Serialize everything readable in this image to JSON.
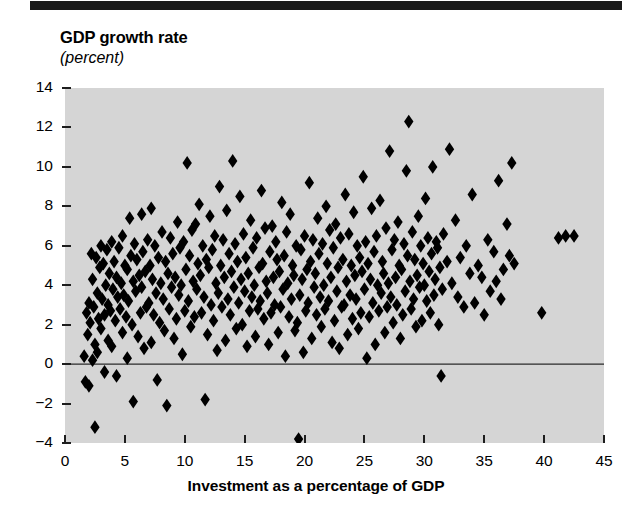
{
  "figure": {
    "title": "GDP growth rate",
    "subtitle": "(percent)",
    "xaxis_title": "Investment as a percentage of GDP",
    "plot_background_color": "#d5d5d5",
    "marker_color": "#000000",
    "rule_color": "#1a1a1a"
  },
  "chart_data": {
    "type": "scatter",
    "title": "GDP growth rate",
    "subtitle": "(percent)",
    "xlabel": "Investment as a percentage of GDP",
    "ylabel": "GDP growth rate (percent)",
    "xlim": [
      0,
      45
    ],
    "ylim": [
      -4,
      14
    ],
    "xticks": [
      0,
      5,
      10,
      15,
      20,
      25,
      30,
      35,
      40,
      45
    ],
    "yticks": [
      -4,
      -2,
      0,
      2,
      4,
      6,
      8,
      10,
      12,
      14
    ],
    "xtick_labels": [
      "0",
      "5",
      "10",
      "15",
      "20",
      "25",
      "30",
      "35",
      "40",
      "45"
    ],
    "ytick_labels": [
      "-4",
      "-2",
      "0",
      "2",
      "4",
      "6",
      "8",
      "10",
      "12",
      "14"
    ],
    "grid": false,
    "legend": null,
    "zero_line": 0,
    "marker": "diamond",
    "marker_color": "#000000",
    "n_points": 396,
    "points": [
      [
        1.6,
        0.4
      ],
      [
        1.7,
        -0.9
      ],
      [
        1.8,
        2.6
      ],
      [
        1.9,
        1.5
      ],
      [
        2.0,
        3.1
      ],
      [
        2.0,
        -1.1
      ],
      [
        2.1,
        2.1
      ],
      [
        2.2,
        5.6
      ],
      [
        2.3,
        4.3
      ],
      [
        2.3,
        0.2
      ],
      [
        2.4,
        2.9
      ],
      [
        2.5,
        -3.2
      ],
      [
        2.5,
        1.0
      ],
      [
        2.6,
        5.4
      ],
      [
        2.7,
        3.6
      ],
      [
        2.7,
        0.6
      ],
      [
        2.8,
        2.3
      ],
      [
        2.9,
        4.9
      ],
      [
        3.0,
        6.0
      ],
      [
        3.0,
        1.8
      ],
      [
        3.1,
        3.3
      ],
      [
        3.2,
        5.1
      ],
      [
        3.3,
        2.5
      ],
      [
        3.3,
        -0.4
      ],
      [
        3.4,
        4.0
      ],
      [
        3.5,
        5.8
      ],
      [
        3.6,
        3.0
      ],
      [
        3.6,
        1.2
      ],
      [
        3.7,
        4.6
      ],
      [
        3.8,
        2.7
      ],
      [
        3.9,
        6.2
      ],
      [
        3.9,
        0.9
      ],
      [
        4.0,
        3.8
      ],
      [
        4.1,
        5.2
      ],
      [
        4.2,
        2.2
      ],
      [
        4.3,
        4.4
      ],
      [
        4.3,
        -0.6
      ],
      [
        4.4,
        3.4
      ],
      [
        4.5,
        5.9
      ],
      [
        4.6,
        2.8
      ],
      [
        4.7,
        4.1
      ],
      [
        4.8,
        6.5
      ],
      [
        4.8,
        1.6
      ],
      [
        4.9,
        3.5
      ],
      [
        5.0,
        5.0
      ],
      [
        5.1,
        2.4
      ],
      [
        5.2,
        4.8
      ],
      [
        5.2,
        0.3
      ],
      [
        5.3,
        3.2
      ],
      [
        5.4,
        7.4
      ],
      [
        5.5,
        5.5
      ],
      [
        5.6,
        2.0
      ],
      [
        5.7,
        4.2
      ],
      [
        5.7,
        -1.9
      ],
      [
        5.8,
        6.1
      ],
      [
        5.9,
        3.7
      ],
      [
        6.0,
        5.3
      ],
      [
        6.1,
        1.4
      ],
      [
        6.2,
        4.5
      ],
      [
        6.3,
        2.6
      ],
      [
        6.4,
        7.6
      ],
      [
        6.4,
        3.9
      ],
      [
        6.5,
        5.7
      ],
      [
        6.6,
        0.8
      ],
      [
        6.7,
        4.7
      ],
      [
        6.8,
        2.9
      ],
      [
        6.9,
        6.3
      ],
      [
        7.0,
        3.1
      ],
      [
        7.1,
        5.0
      ],
      [
        7.2,
        7.9
      ],
      [
        7.2,
        1.1
      ],
      [
        7.3,
        4.3
      ],
      [
        7.4,
        2.5
      ],
      [
        7.5,
        6.0
      ],
      [
        7.6,
        3.6
      ],
      [
        7.7,
        -0.8
      ],
      [
        7.8,
        5.4
      ],
      [
        7.9,
        2.1
      ],
      [
        8.0,
        4.1
      ],
      [
        8.1,
        6.7
      ],
      [
        8.2,
        3.3
      ],
      [
        8.3,
        1.7
      ],
      [
        8.4,
        5.2
      ],
      [
        8.5,
        -2.1
      ],
      [
        8.6,
        4.6
      ],
      [
        8.7,
        2.8
      ],
      [
        8.8,
        6.4
      ],
      [
        8.9,
        3.9
      ],
      [
        9.0,
        5.6
      ],
      [
        9.1,
        1.3
      ],
      [
        9.2,
        4.4
      ],
      [
        9.3,
        2.3
      ],
      [
        9.4,
        7.2
      ],
      [
        9.5,
        3.5
      ],
      [
        9.6,
        5.9
      ],
      [
        9.7,
        4.0
      ],
      [
        9.8,
        0.5
      ],
      [
        9.9,
        6.2
      ],
      [
        10.0,
        2.7
      ],
      [
        10.1,
        4.8
      ],
      [
        10.2,
        10.2
      ],
      [
        10.3,
        3.2
      ],
      [
        10.4,
        5.5
      ],
      [
        10.5,
        1.9
      ],
      [
        10.6,
        6.8
      ],
      [
        10.7,
        4.2
      ],
      [
        10.8,
        2.4
      ],
      [
        10.9,
        7.1
      ],
      [
        11.0,
        3.8
      ],
      [
        11.1,
        5.1
      ],
      [
        11.2,
        8.1
      ],
      [
        11.3,
        4.5
      ],
      [
        11.4,
        2.6
      ],
      [
        11.5,
        6.0
      ],
      [
        11.6,
        3.4
      ],
      [
        11.7,
        -1.8
      ],
      [
        11.8,
        5.3
      ],
      [
        11.9,
        1.5
      ],
      [
        12.0,
        4.9
      ],
      [
        12.1,
        7.5
      ],
      [
        12.2,
        3.0
      ],
      [
        12.3,
        5.8
      ],
      [
        12.4,
        2.2
      ],
      [
        12.5,
        6.5
      ],
      [
        12.6,
        4.1
      ],
      [
        12.7,
        0.7
      ],
      [
        12.8,
        3.6
      ],
      [
        12.9,
        9.0
      ],
      [
        13.0,
        5.0
      ],
      [
        13.1,
        2.9
      ],
      [
        13.2,
        6.3
      ],
      [
        13.3,
        4.4
      ],
      [
        13.4,
        1.2
      ],
      [
        13.5,
        7.8
      ],
      [
        13.6,
        3.3
      ],
      [
        13.7,
        5.6
      ],
      [
        13.8,
        2.5
      ],
      [
        13.9,
        4.7
      ],
      [
        14.0,
        10.3
      ],
      [
        14.1,
        3.9
      ],
      [
        14.2,
        6.1
      ],
      [
        14.3,
        1.8
      ],
      [
        14.4,
        5.2
      ],
      [
        14.5,
        3.1
      ],
      [
        14.6,
        8.5
      ],
      [
        14.7,
        4.3
      ],
      [
        14.8,
        2.0
      ],
      [
        14.9,
        6.6
      ],
      [
        15.0,
        3.7
      ],
      [
        15.1,
        5.4
      ],
      [
        15.2,
        0.9
      ],
      [
        15.3,
        4.6
      ],
      [
        15.4,
        2.7
      ],
      [
        15.5,
        7.3
      ],
      [
        15.6,
        3.4
      ],
      [
        15.7,
        5.9
      ],
      [
        15.8,
        4.0
      ],
      [
        15.9,
        1.4
      ],
      [
        16.0,
        6.4
      ],
      [
        16.1,
        2.8
      ],
      [
        16.2,
        4.9
      ],
      [
        16.3,
        3.2
      ],
      [
        16.4,
        8.8
      ],
      [
        16.5,
        5.1
      ],
      [
        16.6,
        2.3
      ],
      [
        16.7,
        6.9
      ],
      [
        16.8,
        4.2
      ],
      [
        16.9,
        3.6
      ],
      [
        17.0,
        1.0
      ],
      [
        17.1,
        5.7
      ],
      [
        17.2,
        2.6
      ],
      [
        17.3,
        7.0
      ],
      [
        17.4,
        4.4
      ],
      [
        17.5,
        3.0
      ],
      [
        17.6,
        6.2
      ],
      [
        17.7,
        5.3
      ],
      [
        17.8,
        1.6
      ],
      [
        17.9,
        4.7
      ],
      [
        18.0,
        2.9
      ],
      [
        18.1,
        8.2
      ],
      [
        18.2,
        3.8
      ],
      [
        18.3,
        5.5
      ],
      [
        18.4,
        0.4
      ],
      [
        18.5,
        6.7
      ],
      [
        18.6,
        4.1
      ],
      [
        18.7,
        2.4
      ],
      [
        18.8,
        7.6
      ],
      [
        18.9,
        3.3
      ],
      [
        19.0,
        5.0
      ],
      [
        19.1,
        4.5
      ],
      [
        19.2,
        1.7
      ],
      [
        19.3,
        6.0
      ],
      [
        19.4,
        2.1
      ],
      [
        19.5,
        -3.8
      ],
      [
        19.6,
        3.5
      ],
      [
        19.7,
        5.8
      ],
      [
        19.8,
        4.3
      ],
      [
        19.9,
        0.6
      ],
      [
        20.0,
        6.5
      ],
      [
        20.1,
        2.7
      ],
      [
        20.2,
        4.8
      ],
      [
        20.3,
        3.1
      ],
      [
        20.4,
        9.2
      ],
      [
        20.5,
        5.2
      ],
      [
        20.6,
        1.3
      ],
      [
        20.7,
        6.3
      ],
      [
        20.8,
        3.9
      ],
      [
        20.9,
        4.6
      ],
      [
        21.0,
        2.5
      ],
      [
        21.1,
        7.4
      ],
      [
        21.2,
        5.6
      ],
      [
        21.3,
        3.4
      ],
      [
        21.4,
        1.9
      ],
      [
        21.5,
        6.1
      ],
      [
        21.6,
        4.0
      ],
      [
        21.7,
        2.8
      ],
      [
        21.8,
        8.0
      ],
      [
        21.9,
        5.1
      ],
      [
        22.0,
        3.2
      ],
      [
        22.1,
        6.8
      ],
      [
        22.2,
        4.4
      ],
      [
        22.3,
        1.1
      ],
      [
        22.4,
        5.9
      ],
      [
        22.5,
        2.2
      ],
      [
        22.6,
        7.1
      ],
      [
        22.7,
        3.7
      ],
      [
        22.8,
        4.9
      ],
      [
        22.9,
        0.8
      ],
      [
        23.0,
        6.4
      ],
      [
        23.1,
        2.9
      ],
      [
        23.2,
        5.3
      ],
      [
        23.3,
        3.0
      ],
      [
        23.4,
        8.6
      ],
      [
        23.5,
        4.2
      ],
      [
        23.6,
        1.5
      ],
      [
        23.7,
        6.6
      ],
      [
        23.8,
        3.5
      ],
      [
        23.9,
        5.0
      ],
      [
        24.0,
        2.3
      ],
      [
        24.1,
        7.7
      ],
      [
        24.2,
        4.5
      ],
      [
        24.3,
        3.3
      ],
      [
        24.4,
        6.0
      ],
      [
        24.5,
        1.8
      ],
      [
        24.6,
        5.4
      ],
      [
        24.7,
        2.6
      ],
      [
        24.8,
        4.7
      ],
      [
        24.9,
        9.5
      ],
      [
        25.0,
        3.8
      ],
      [
        25.1,
        6.2
      ],
      [
        25.2,
        0.3
      ],
      [
        25.3,
        5.1
      ],
      [
        25.4,
        2.4
      ],
      [
        25.5,
        4.3
      ],
      [
        25.6,
        7.9
      ],
      [
        25.7,
        3.1
      ],
      [
        25.8,
        5.7
      ],
      [
        25.9,
        1.0
      ],
      [
        26.0,
        6.5
      ],
      [
        26.1,
        4.0
      ],
      [
        26.2,
        2.7
      ],
      [
        26.3,
        8.3
      ],
      [
        26.4,
        3.6
      ],
      [
        26.5,
        5.2
      ],
      [
        26.6,
        4.6
      ],
      [
        26.7,
        1.6
      ],
      [
        26.8,
        6.9
      ],
      [
        26.9,
        2.9
      ],
      [
        27.0,
        4.1
      ],
      [
        27.1,
        10.8
      ],
      [
        27.2,
        3.4
      ],
      [
        27.3,
        5.8
      ],
      [
        27.4,
        2.1
      ],
      [
        27.5,
        6.3
      ],
      [
        27.6,
        4.4
      ],
      [
        27.7,
        3.0
      ],
      [
        27.8,
        7.2
      ],
      [
        27.9,
        5.0
      ],
      [
        28.0,
        1.3
      ],
      [
        28.1,
        4.8
      ],
      [
        28.2,
        2.5
      ],
      [
        28.3,
        6.1
      ],
      [
        28.4,
        3.7
      ],
      [
        28.5,
        9.8
      ],
      [
        28.6,
        5.5
      ],
      [
        28.7,
        12.3
      ],
      [
        28.8,
        4.2
      ],
      [
        28.9,
        2.8
      ],
      [
        29.0,
        6.7
      ],
      [
        29.1,
        3.3
      ],
      [
        29.2,
        5.3
      ],
      [
        29.3,
        1.9
      ],
      [
        29.4,
        4.5
      ],
      [
        29.5,
        7.5
      ],
      [
        29.6,
        3.9
      ],
      [
        29.7,
        6.0
      ],
      [
        29.8,
        2.2
      ],
      [
        29.9,
        5.1
      ],
      [
        30.0,
        4.0
      ],
      [
        30.1,
        8.4
      ],
      [
        30.2,
        3.2
      ],
      [
        30.3,
        6.4
      ],
      [
        30.4,
        4.7
      ],
      [
        30.5,
        2.6
      ],
      [
        30.6,
        5.6
      ],
      [
        30.7,
        10.0
      ],
      [
        30.8,
        3.5
      ],
      [
        30.9,
        4.3
      ],
      [
        31.0,
        6.2
      ],
      [
        31.1,
        5.9
      ],
      [
        31.2,
        2.0
      ],
      [
        31.3,
        4.9
      ],
      [
        31.4,
        -0.6
      ],
      [
        31.5,
        3.8
      ],
      [
        31.6,
        6.6
      ],
      [
        31.9,
        5.2
      ],
      [
        32.1,
        10.9
      ],
      [
        32.3,
        4.1
      ],
      [
        32.6,
        7.3
      ],
      [
        32.8,
        3.4
      ],
      [
        33.0,
        5.4
      ],
      [
        33.3,
        2.9
      ],
      [
        33.5,
        6.0
      ],
      [
        33.8,
        4.6
      ],
      [
        34.0,
        8.6
      ],
      [
        34.2,
        3.1
      ],
      [
        34.5,
        5.0
      ],
      [
        34.8,
        4.4
      ],
      [
        35.0,
        2.5
      ],
      [
        35.3,
        6.3
      ],
      [
        35.5,
        3.7
      ],
      [
        35.8,
        5.7
      ],
      [
        36.0,
        4.2
      ],
      [
        36.2,
        9.3
      ],
      [
        36.4,
        3.3
      ],
      [
        36.6,
        4.8
      ],
      [
        36.9,
        7.1
      ],
      [
        37.1,
        5.5
      ],
      [
        37.3,
        10.2
      ],
      [
        37.5,
        5.1
      ],
      [
        39.8,
        2.6
      ],
      [
        41.2,
        6.4
      ],
      [
        41.8,
        6.5
      ],
      [
        42.5,
        6.5
      ]
    ]
  }
}
